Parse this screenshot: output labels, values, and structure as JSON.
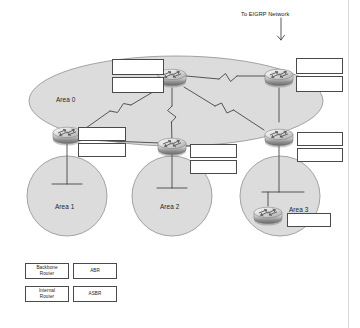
{
  "diagram": {
    "type": "network-topology",
    "background_color": "#ffffff",
    "area_fill_color": "#dcdcdc",
    "area_stroke_color": "#8a8a8a",
    "link_color": "#3c3c3c",
    "box_border_color": "#4a4a4a",
    "annotations": {
      "eigrp": "To EIGRP Network"
    },
    "areas": [
      {
        "id": "area0",
        "label": "Area 0",
        "shape": "ellipse"
      },
      {
        "id": "area1",
        "label": "Area 1",
        "shape": "circle"
      },
      {
        "id": "area2",
        "label": "Area 2",
        "shape": "circle"
      },
      {
        "id": "area3",
        "label": "Area 3",
        "shape": "circle"
      }
    ],
    "routers": [
      {
        "id": "r-backbone-center",
        "icon": "router-icon",
        "area": "area0"
      },
      {
        "id": "r-asbr",
        "icon": "router-icon",
        "area": "area0"
      },
      {
        "id": "r-abr-area1",
        "icon": "router-icon",
        "area": "area1"
      },
      {
        "id": "r-abr-area2",
        "icon": "router-icon",
        "area": "area2"
      },
      {
        "id": "r-abr-area3",
        "icon": "router-icon",
        "area": "area3"
      },
      {
        "id": "r-internal-area3",
        "icon": "router-icon",
        "area": "area3"
      }
    ],
    "blank_boxes": [
      {
        "id": "blank-center-top",
        "value": ""
      },
      {
        "id": "blank-center-bottom",
        "value": ""
      },
      {
        "id": "blank-asbr-top",
        "value": ""
      },
      {
        "id": "blank-asbr-bottom",
        "value": ""
      },
      {
        "id": "blank-area1-top",
        "value": ""
      },
      {
        "id": "blank-area1-bottom",
        "value": ""
      },
      {
        "id": "blank-area2-top",
        "value": ""
      },
      {
        "id": "blank-area2-bottom",
        "value": ""
      },
      {
        "id": "blank-area3-top",
        "value": ""
      },
      {
        "id": "blank-area3-bottom",
        "value": ""
      },
      {
        "id": "blank-area3-internal",
        "value": ""
      }
    ]
  },
  "legend": {
    "items": [
      {
        "id": "backbone-router",
        "label": "Backbone\nRouter"
      },
      {
        "id": "abr",
        "label": "ABR"
      },
      {
        "id": "internal-router",
        "label": "Internal\nRouter"
      },
      {
        "id": "asbr",
        "label": "ASBR"
      }
    ]
  }
}
